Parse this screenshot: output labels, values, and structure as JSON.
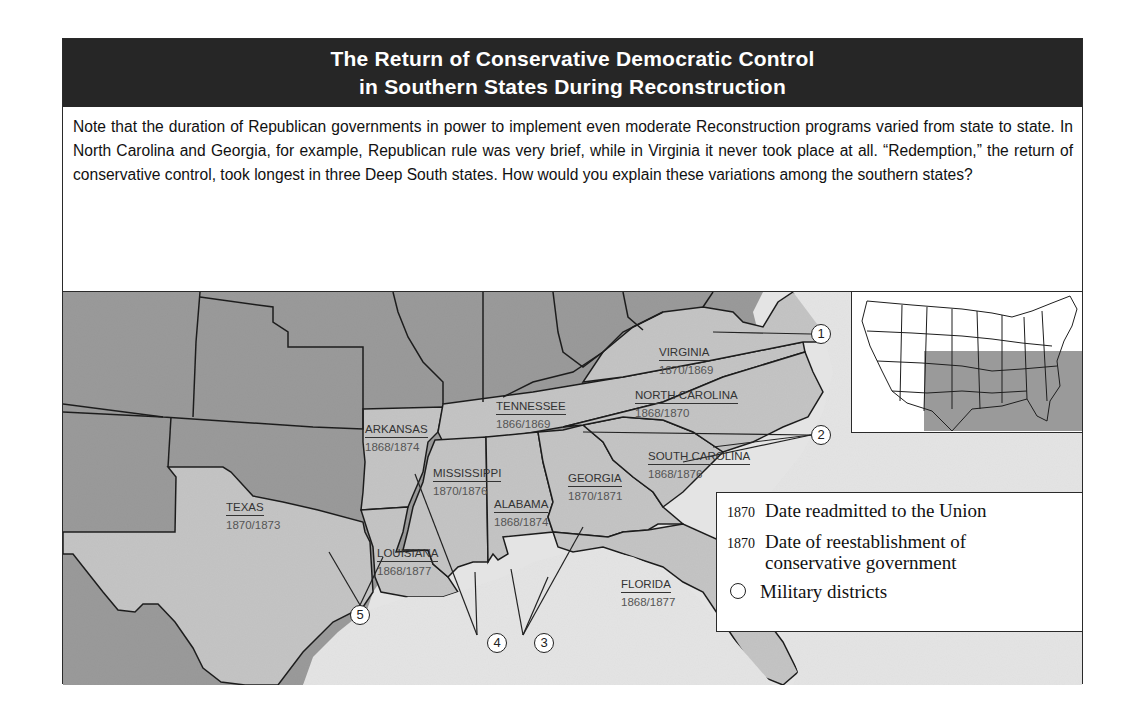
{
  "header": {
    "title_line1": "The Return of Conservative Democratic Control",
    "title_line2": "in Southern States During Reconstruction"
  },
  "note": {
    "text": "Note that the duration of Republican governments in power to implement even moderate Reconstruction programs varied from state to state. In North Carolina and Georgia, for example, Republican rule was very brief, while in Virginia it never took place at all. “Redemption,” the return of conservative control, took longest in three Deep South states. How would you explain these variations among the southern states?"
  },
  "map": {
    "colors": {
      "other_states": "#9a9a9a",
      "southern_states": "#c4c4c4",
      "water": "#e4e4e4",
      "border": "#1e1e1e"
    },
    "states": [
      {
        "name": "VIRGINIA",
        "dates": "1870/1869",
        "readmitted": 1870,
        "conservative": 1869
      },
      {
        "name": "NORTH CAROLINA",
        "dates": "1868/1870",
        "readmitted": 1868,
        "conservative": 1870
      },
      {
        "name": "TENNESSEE",
        "dates": "1866/1869",
        "readmitted": 1866,
        "conservative": 1869
      },
      {
        "name": "ARKANSAS",
        "dates": "1868/1874",
        "readmitted": 1868,
        "conservative": 1874
      },
      {
        "name": "SOUTH CAROLINA",
        "dates": "1868/1876",
        "readmitted": 1868,
        "conservative": 1876
      },
      {
        "name": "MISSISSIPPI",
        "dates": "1870/1876",
        "readmitted": 1870,
        "conservative": 1876
      },
      {
        "name": "GEORGIA",
        "dates": "1870/1871",
        "readmitted": 1870,
        "conservative": 1871
      },
      {
        "name": "ALABAMA",
        "dates": "1868/1874",
        "readmitted": 1868,
        "conservative": 1874
      },
      {
        "name": "TEXAS",
        "dates": "1870/1873",
        "readmitted": 1870,
        "conservative": 1873
      },
      {
        "name": "LOUISIANA",
        "dates": "1868/1877",
        "readmitted": 1868,
        "conservative": 1877
      },
      {
        "name": "FLORIDA",
        "dates": "1868/1877",
        "readmitted": 1868,
        "conservative": 1877
      }
    ],
    "military_districts": [
      {
        "number": "1",
        "states": [
          "Virginia"
        ]
      },
      {
        "number": "2",
        "states": [
          "North Carolina",
          "South Carolina"
        ]
      },
      {
        "number": "3",
        "states": [
          "Georgia",
          "Alabama",
          "Florida"
        ]
      },
      {
        "number": "4",
        "states": [
          "Mississippi",
          "Arkansas"
        ]
      },
      {
        "number": "5",
        "states": [
          "Texas",
          "Louisiana"
        ]
      }
    ]
  },
  "legend": {
    "readmitted": {
      "sample": "1870",
      "label": "Date readmitted to the Union"
    },
    "conservative": {
      "sample": "1870",
      "label_line1": "Date of reestablishment of",
      "label_line2": "conservative government"
    },
    "districts": {
      "label": "Military districts"
    }
  }
}
